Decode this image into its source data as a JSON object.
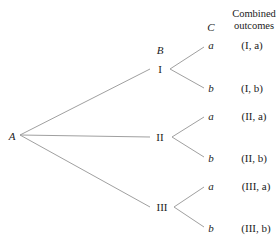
{
  "diagram": {
    "type": "tree",
    "root": "A",
    "level_labels": {
      "B": "B",
      "C": "C"
    },
    "column_header": [
      "Combined",
      "outcomes"
    ],
    "branches": [
      {
        "label": "I",
        "leaves": [
          {
            "label": "a",
            "outcome": "(I, a)"
          },
          {
            "label": "b",
            "outcome": "(I, b)"
          }
        ]
      },
      {
        "label": "II",
        "leaves": [
          {
            "label": "a",
            "outcome": "(II, a)"
          },
          {
            "label": "b",
            "outcome": "(II, b)"
          }
        ]
      },
      {
        "label": "III",
        "leaves": [
          {
            "label": "a",
            "outcome": "(III, a)"
          },
          {
            "label": "b",
            "outcome": "(III, b)"
          }
        ]
      }
    ],
    "line_color": "#9a9a9a"
  }
}
